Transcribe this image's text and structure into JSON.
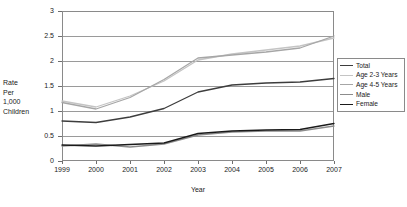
{
  "chart_data": {
    "type": "line",
    "title": "",
    "xlabel": "Year",
    "ylabel": "Rate Per 1,000 Children",
    "ylabel_lines": [
      "Rate",
      "Per",
      "1,000",
      "Children"
    ],
    "x": [
      "1999",
      "2000",
      "2001",
      "2002",
      "2003",
      "2004",
      "2005",
      "2006",
      "2007"
    ],
    "categories": [
      "1999",
      "2000",
      "2001",
      "2002",
      "2003",
      "2004",
      "2005",
      "2006",
      "2007"
    ],
    "ylim": [
      0,
      3
    ],
    "ytick_labels": [
      "0",
      "0.5",
      "1",
      "1.5",
      "2",
      "2.5",
      "3"
    ],
    "ytick_values": [
      0,
      0.5,
      1,
      1.5,
      2,
      2.5,
      3
    ],
    "grid": true,
    "legend_position": "right",
    "series": [
      {
        "name": "Total",
        "color": "#3d3d3d",
        "width": 1.3,
        "values": [
          0.8,
          0.77,
          0.88,
          1.05,
          1.38,
          1.52,
          1.56,
          1.58,
          1.65
        ]
      },
      {
        "name": "Age 2-3 Years",
        "color": "#c4c4c4",
        "width": 1.3,
        "values": [
          1.2,
          1.08,
          1.3,
          1.6,
          2.02,
          2.14,
          2.22,
          2.3,
          2.46
        ]
      },
      {
        "name": "Age 4-5 Years",
        "color": "#a6a6a6",
        "width": 1.3,
        "values": [
          1.17,
          1.04,
          1.27,
          1.63,
          2.06,
          2.12,
          2.18,
          2.26,
          2.5
        ]
      },
      {
        "name": "Male",
        "color": "#8c8c8c",
        "width": 1.3,
        "values": [
          0.3,
          0.34,
          0.28,
          0.34,
          0.52,
          0.58,
          0.6,
          0.6,
          0.7
        ]
      },
      {
        "name": "Female",
        "color": "#1a1a1a",
        "width": 1.3,
        "values": [
          0.32,
          0.3,
          0.33,
          0.36,
          0.55,
          0.6,
          0.62,
          0.63,
          0.75
        ]
      }
    ]
  },
  "legend": {
    "items": [
      {
        "label": "Total"
      },
      {
        "label": "Age 2-3 Years"
      },
      {
        "label": "Age 4-5 Years"
      },
      {
        "label": "Male"
      },
      {
        "label": "Female"
      }
    ]
  },
  "axes": {
    "x_title": "Year",
    "y_title_lines": [
      "Rate",
      "Per",
      "1,000",
      "Children"
    ],
    "y_ticks": [
      "3",
      "2.5",
      "2",
      "1.5",
      "1",
      "0.5",
      "0"
    ],
    "x_ticks": [
      "1999",
      "2000",
      "2001",
      "2002",
      "2003",
      "2004",
      "2005",
      "2006",
      "2007"
    ]
  }
}
